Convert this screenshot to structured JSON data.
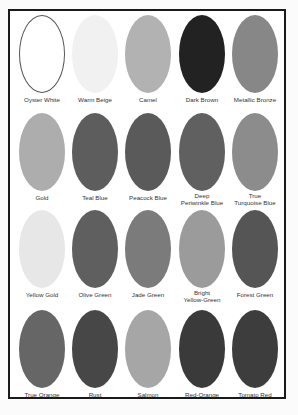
{
  "chart_title": "",
  "frame": {
    "border_color": "#1a1a1a",
    "background": "#ffffff"
  },
  "swatches": [
    {
      "label": "Oyster White",
      "color": "#ffffff",
      "outlined": true
    },
    {
      "label": "Warm Beige",
      "color": "#f1f1f1"
    },
    {
      "label": "Camel",
      "color": "#b2b2b2"
    },
    {
      "label": "Dark Brown",
      "color": "#222222"
    },
    {
      "label": "Metallic Bronze",
      "color": "#878787"
    },
    {
      "label": "Gold",
      "color": "#adadad"
    },
    {
      "label": "Teal Blue",
      "color": "#5d5d5d"
    },
    {
      "label": "Peacock Blue",
      "color": "#5a5a5a"
    },
    {
      "label": "Deep Periwinkle Blue",
      "color": "#606060"
    },
    {
      "label": "True Turquoise Blue",
      "color": "#8c8c8c"
    },
    {
      "label": "Yellow Gold",
      "color": "#e7e7e7"
    },
    {
      "label": "Olive Green",
      "color": "#5f5f5f"
    },
    {
      "label": "Jade Green",
      "color": "#7b7b7b"
    },
    {
      "label": "Bright Yellow-Green",
      "color": "#9b9b9b"
    },
    {
      "label": "Forest Green",
      "color": "#555555"
    },
    {
      "label": "True Orange",
      "color": "#666666"
    },
    {
      "label": "Rust",
      "color": "#474747"
    },
    {
      "label": "Salmon",
      "color": "#a6a6a6"
    },
    {
      "label": "Red-Orange",
      "color": "#3a3a3a"
    },
    {
      "label": "Tomato Red",
      "color": "#3d3d3d"
    }
  ],
  "labels_display": [
    [
      "Oyster White"
    ],
    [
      "Warm Beige"
    ],
    [
      "Camel"
    ],
    [
      "Dark Brown"
    ],
    [
      "Metallic Bronze"
    ],
    [
      "Gold"
    ],
    [
      "Teal Blue"
    ],
    [
      "Peacock Blue"
    ],
    [
      "Deep",
      "Periwinkle Blue"
    ],
    [
      "True",
      "Turquoise Blue"
    ],
    [
      "Yellow Gold"
    ],
    [
      "Olive Green"
    ],
    [
      "Jade Green"
    ],
    [
      "Bright",
      "Yellow-Green"
    ],
    [
      "Forest Green"
    ],
    [
      "True Orange"
    ],
    [
      "Rust"
    ],
    [
      "Salmon"
    ],
    [
      "Red-Orange"
    ],
    [
      "Tomato Red"
    ]
  ]
}
